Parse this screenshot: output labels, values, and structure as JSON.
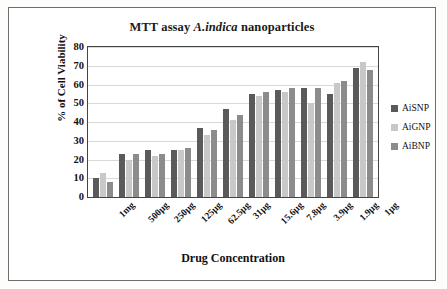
{
  "figure": {
    "title_prefix": "MTT assay ",
    "title_italic": "A.indica",
    "title_suffix": " nanoparticles"
  },
  "chart_data": {
    "type": "bar",
    "title": "MTT assay A.indica nanoparticles",
    "xlabel": "Drug Concentration",
    "ylabel": "% of Cell Viability",
    "ylim": [
      0,
      80
    ],
    "yticks": [
      0,
      10,
      20,
      30,
      40,
      50,
      60,
      70,
      80
    ],
    "grid": true,
    "legend_position": "right",
    "categories": [
      "1mg",
      "500µg",
      "250µg",
      "125µg",
      "62.5µg",
      "31µg",
      "15.6µg",
      "7.8µg",
      "3.9µg",
      "1.9µg",
      "1µg"
    ],
    "series": [
      {
        "name": "AiSNP",
        "color": "#5a5a5a",
        "values": [
          10,
          23,
          25,
          25,
          37,
          47,
          55,
          57,
          58,
          55,
          69
        ]
      },
      {
        "name": "AiGNP",
        "color": "#c8c8c8",
        "values": [
          13,
          20,
          22,
          25,
          33,
          41,
          54,
          56,
          50,
          61,
          72
        ]
      },
      {
        "name": "AiBNP",
        "color": "#8c8c8c",
        "values": [
          8,
          23,
          23,
          26,
          36,
          44,
          56,
          58,
          58,
          62,
          68
        ]
      }
    ]
  }
}
